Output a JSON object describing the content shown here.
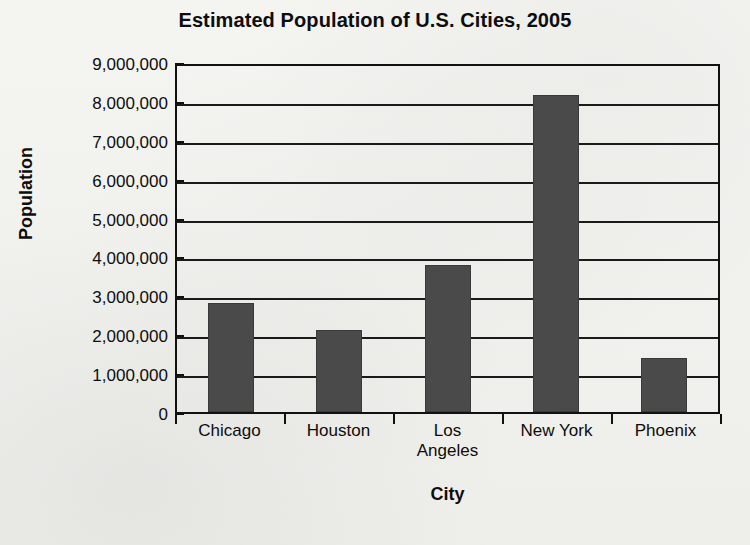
{
  "chart_data": {
    "type": "bar",
    "title": "Estimated Population of U.S. Cities, 2005",
    "xlabel": "City",
    "ylabel": "Population",
    "categories": [
      "Chicago",
      "Houston",
      "Los Angeles",
      "New York",
      "Phoenix"
    ],
    "category_lines": [
      [
        "Chicago"
      ],
      [
        "Houston"
      ],
      [
        "Los",
        "Angeles"
      ],
      [
        "New York"
      ],
      [
        "Phoenix"
      ]
    ],
    "values": [
      2800000,
      2100000,
      3770000,
      8150000,
      1380000
    ],
    "ylim": [
      0,
      9000000
    ],
    "ytick_values": [
      9000000,
      8000000,
      7000000,
      6000000,
      5000000,
      4000000,
      3000000,
      2000000,
      1000000,
      0
    ],
    "ytick_labels": [
      "9,000,000",
      "8,000,000",
      "7,000,000",
      "6,000,000",
      "5,000,000",
      "4,000,000",
      "3,000,000",
      "2,000,000",
      "1,000,000",
      "0"
    ],
    "grid": true,
    "grid_axis": "y",
    "legend": false,
    "bar_color": "#4a4a4a",
    "axis_color": "#111111",
    "background_color": "#f2f2ee"
  }
}
